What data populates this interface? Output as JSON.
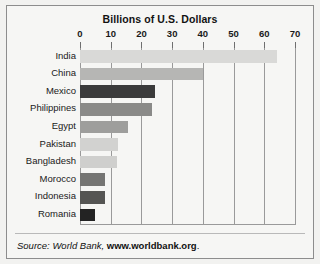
{
  "chart_data": {
    "type": "bar",
    "orientation": "horizontal",
    "title": "Billions of U.S. Dollars",
    "xlabel": "",
    "ylabel": "",
    "xlim": [
      0,
      70
    ],
    "xticks": [
      0,
      10,
      20,
      30,
      40,
      50,
      60,
      70
    ],
    "xtick_labels": [
      "0",
      "10",
      "20",
      "30",
      "40",
      "50",
      "60",
      "70"
    ],
    "grid": "vertical",
    "legend": "none",
    "categories": [
      "India",
      "China",
      "Mexico",
      "Philippines",
      "Egypt",
      "Pakistan",
      "Bangladesh",
      "Morocco",
      "Indonesia",
      "Romania"
    ],
    "values": [
      64,
      40,
      24.5,
      23.5,
      15.5,
      12.5,
      12,
      8,
      8,
      5
    ],
    "bar_colors": [
      "#d9d9d7",
      "#b6b6b4",
      "#3b3b3b",
      "#8a8a88",
      "#9e9e9c",
      "#d2d2d0",
      "#cfcfcd",
      "#757573",
      "#555553",
      "#232323"
    ],
    "series": [
      {
        "name": "Remittances",
        "points": [
          {
            "category": "India",
            "value": 64,
            "color": "#d9d9d7"
          },
          {
            "category": "China",
            "value": 40,
            "color": "#b6b6b4"
          },
          {
            "category": "Mexico",
            "value": 24.5,
            "color": "#3b3b3b"
          },
          {
            "category": "Philippines",
            "value": 23.5,
            "color": "#8a8a88"
          },
          {
            "category": "Egypt",
            "value": 15.5,
            "color": "#9e9e9c"
          },
          {
            "category": "Pakistan",
            "value": 12.5,
            "color": "#d2d2d0"
          },
          {
            "category": "Bangladesh",
            "value": 12,
            "color": "#cfcfcd"
          },
          {
            "category": "Morocco",
            "value": 8,
            "color": "#757573"
          },
          {
            "category": "Indonesia",
            "value": 8,
            "color": "#555553"
          },
          {
            "category": "Romania",
            "value": 5,
            "color": "#232323"
          }
        ]
      }
    ]
  },
  "source": {
    "lead": "Source: World Bank, ",
    "url": "www.worldbank.org",
    "trailing": "."
  },
  "colors": {
    "frame": "#8d8d8d",
    "gridline": "#9a9a9a",
    "text": "#1a1a1a",
    "background": "#f6f6f4"
  }
}
